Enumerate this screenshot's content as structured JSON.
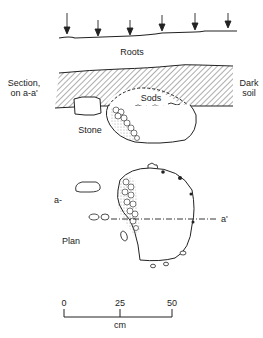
{
  "labels": {
    "roots": "Roots",
    "section_line1": "Section,",
    "section_line2": "on a-a'",
    "dark_soil_line1": "Dark",
    "dark_soil_line2": "soil",
    "sods": "Sods",
    "stone": "Stone",
    "plan": "Plan",
    "a": "a-",
    "a_prime": "a'"
  },
  "scale_bar": {
    "ticks": [
      "0",
      "25",
      "50"
    ],
    "unit": "cm"
  },
  "colors": {
    "ink": "#222222",
    "background": "#ffffff"
  }
}
